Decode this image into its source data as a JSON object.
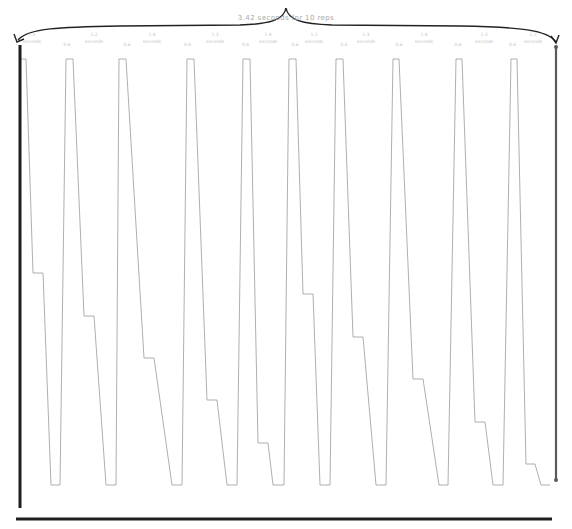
{
  "header": {
    "label": "3.42 seconds for 10 reps"
  },
  "rep_labels": [
    {
      "top": "1.1",
      "bottom": "seconds",
      "x": 32,
      "gap": "0.6"
    },
    {
      "top": "1.2",
      "bottom": "seconds",
      "x": 94,
      "gap": "0.6"
    },
    {
      "top": "1.4",
      "bottom": "seconds",
      "x": 152,
      "gap": "0.6"
    },
    {
      "top": "1.3",
      "bottom": "seconds",
      "x": 215,
      "gap": "0.6"
    },
    {
      "top": "1.4",
      "bottom": "seconds",
      "x": 268,
      "gap": "0.6"
    },
    {
      "top": "1.2",
      "bottom": "seconds",
      "x": 314,
      "gap": "0.6"
    },
    {
      "top": "1.3",
      "bottom": "seconds",
      "x": 366,
      "gap": "0.6"
    },
    {
      "top": "1.4",
      "bottom": "seconds",
      "x": 424,
      "gap": "0.6"
    },
    {
      "top": "1.3",
      "bottom": "seconds",
      "x": 484,
      "gap": "0.6"
    },
    {
      "top": "1.2",
      "bottom": "seconds",
      "x": 533,
      "gap": "0.6"
    }
  ],
  "colors": {
    "wave": "#9a9a9a",
    "axis": "#1e1e1e",
    "axis_right": "#5a5a5a",
    "brace": "#222222",
    "label": "#a8a8a8"
  },
  "geometry": {
    "top_y": 59,
    "bottom_y": 485,
    "axis_left_x": 20,
    "axis_right_x": 556,
    "baseline_y": 519
  },
  "cycles": [
    {
      "peak": [
        20,
        26
      ],
      "plateau": [
        33,
        43
      ],
      "plateau_y": 273,
      "bottom": [
        51,
        60
      ]
    },
    {
      "peak": [
        66,
        73
      ],
      "plateau": [
        84,
        94
      ],
      "plateau_y": 316,
      "bottom": [
        106,
        116
      ]
    },
    {
      "peak": [
        119,
        126
      ],
      "plateau": [
        144,
        154
      ],
      "plateau_y": 358,
      "bottom": [
        172,
        182
      ]
    },
    {
      "peak": [
        187,
        194
      ],
      "plateau": [
        207,
        217
      ],
      "plateau_y": 400,
      "bottom": [
        227,
        237
      ]
    },
    {
      "peak": [
        243,
        250
      ],
      "plateau": [
        258,
        268
      ],
      "plateau_y": 443,
      "bottom": [
        273,
        284
      ]
    },
    {
      "peak": [
        289,
        296
      ],
      "plateau": [
        303,
        313
      ],
      "plateau_y": 294,
      "bottom": [
        320,
        330
      ]
    },
    {
      "peak": [
        336,
        343
      ],
      "plateau": [
        353,
        363
      ],
      "plateau_y": 337,
      "bottom": [
        376,
        386
      ]
    },
    {
      "peak": [
        393,
        399
      ],
      "plateau": [
        413,
        423
      ],
      "plateau_y": 379,
      "bottom": [
        439,
        448
      ]
    },
    {
      "peak": [
        456,
        462
      ],
      "plateau": [
        475,
        485
      ],
      "plateau_y": 422,
      "bottom": [
        493,
        503
      ]
    },
    {
      "peak": [
        511,
        517
      ],
      "plateau": [
        526,
        535
      ],
      "plateau_y": 464,
      "bottom": [
        541,
        550
      ]
    }
  ]
}
